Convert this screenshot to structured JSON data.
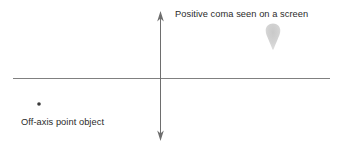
{
  "figure": {
    "type": "optical-aberration-diagram",
    "width": 342,
    "height": 148,
    "background_color": "#ffffff"
  },
  "labels": {
    "coma_label": "Positive coma seen on a screen",
    "object_label": "Off-axis point object"
  },
  "axes": {
    "horizontal": {
      "name": "optical-axis",
      "color": "#808080",
      "x_start": 13,
      "x_end": 330,
      "y": 78,
      "stroke_width": 1
    },
    "vertical": {
      "name": "screen-axis",
      "color": "#6e6e6e",
      "x": 160,
      "y_top": 11,
      "y_bottom": 141,
      "stroke_width": 1,
      "arrow_top": true,
      "arrow_bottom": true
    }
  },
  "markers": {
    "point_object": {
      "name": "off-axis-point-object",
      "cx": 39,
      "cy": 104,
      "radius": 1.7,
      "color": "#3a3a3a"
    },
    "coma_blob": {
      "name": "positive-coma-blob",
      "description": "comet-shaped teardrop flare, rounded head at top tapering to a point below",
      "head_cx": 273,
      "head_cy": 30.5,
      "head_radius": 7,
      "tail_tip_x": 273,
      "tail_tip_y": 50,
      "fill": "#d0d0d0"
    }
  },
  "colors": {
    "text": "#2b2b2b",
    "axis": "#808080",
    "blob": "#d0d0d0",
    "dot": "#3a3a3a"
  }
}
